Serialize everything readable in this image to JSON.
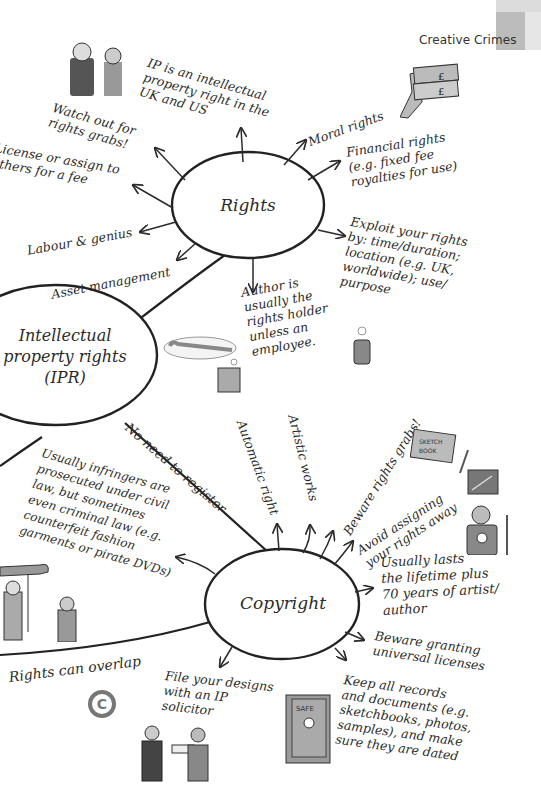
{
  "header": {
    "section_title": "Creative Crimes"
  },
  "nodes": {
    "center": {
      "label": "Intellectual\nproperty rights\n(IPR)"
    },
    "rights": {
      "label": "Rights"
    },
    "copyright": {
      "label": "Copyright"
    }
  },
  "connectors": {
    "center_to_copyright": "No need to register",
    "overlap": "Rights can overlap"
  },
  "rights_branches": [
    {
      "id": "ip-uk-us",
      "text": "IP is an intellectual\nproperty right in the\nUK and US"
    },
    {
      "id": "watch-out",
      "text": "Watch out for\nrights grabs!"
    },
    {
      "id": "license-assign",
      "text": "License or assign to\nothers for a fee"
    },
    {
      "id": "labour-genius",
      "text": "Labour & genius"
    },
    {
      "id": "asset-management",
      "text": "Asset management"
    },
    {
      "id": "moral-rights",
      "text": "Moral rights"
    },
    {
      "id": "financial-rights",
      "text": "Financial rights\n(e.g. fixed fee\nroyalties for use)"
    },
    {
      "id": "exploit-rights",
      "text": "Exploit your rights\nby: time/duration;\nlocation (e.g. UK,\nworldwide); use/\npurpose"
    },
    {
      "id": "author-holder",
      "text": "Author is\nusually the\nrights holder\nunless an\nemployee."
    }
  ],
  "copyright_branches": [
    {
      "id": "infringers",
      "text": "Usually infringers are\nprosecuted under civil\nlaw, but sometimes\neven criminal law (e.g.\ncounterfeit fashion\ngarments or pirate DVDs)"
    },
    {
      "id": "automatic-right",
      "text": "Automatic right"
    },
    {
      "id": "artistic-works",
      "text": "Artistic works"
    },
    {
      "id": "beware-grabs",
      "text": "Beware rights grabs!"
    },
    {
      "id": "avoid-assigning",
      "text": "Avoid assigning\nyour rights away"
    },
    {
      "id": "lifetime",
      "text": "Usually lasts\nthe lifetime plus\n70 years of artist/\nauthor"
    },
    {
      "id": "universal-licenses",
      "text": "Beware granting\nuniversal licenses"
    },
    {
      "id": "keep-records",
      "text": "Keep all records\nand documents (e.g.\nsketchbooks, photos,\nsamples), and make\nsure they are dated"
    },
    {
      "id": "file-designs",
      "text": "File your designs\nwith an IP\nsolicitor"
    }
  ],
  "illustrations": {
    "sketchbook_label": "SKETCH\nBOOK",
    "safe_label": "SAFE",
    "money_symbol": "£",
    "copyright_symbol": "©"
  },
  "colors": {
    "ink": "#2b2b2b",
    "tab_light": "#dcdcdc",
    "tab_dark": "#bcbcbc",
    "ellipse_fill": "#ffffff",
    "illustration_gray": "#8a8a8a"
  }
}
